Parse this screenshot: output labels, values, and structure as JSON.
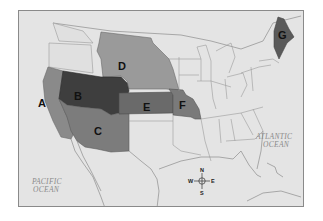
{
  "map": {
    "title": "",
    "regions": [
      {
        "id": "A",
        "label": "A",
        "color": "#8a8a8a",
        "x": 37,
        "y": 102
      },
      {
        "id": "B",
        "label": "B",
        "color": "#3e3e3e",
        "x": 77,
        "y": 95
      },
      {
        "id": "C",
        "label": "C",
        "color": "#7c7c7c",
        "x": 97,
        "y": 130
      },
      {
        "id": "D",
        "label": "D",
        "color": "#9a9a9a",
        "x": 121,
        "y": 65
      },
      {
        "id": "E",
        "label": "E",
        "color": "#6a6a6a",
        "x": 146,
        "y": 106
      },
      {
        "id": "F",
        "label": "F",
        "color": "#7a7a7a",
        "x": 182,
        "y": 104
      },
      {
        "id": "G",
        "label": "G",
        "color": "#5a5a5a",
        "x": 280,
        "y": 33
      }
    ],
    "oceans": [
      {
        "name": "pacific",
        "line1": "PACIFIC",
        "line2": "OCEAN"
      },
      {
        "name": "atlantic",
        "line1": "ATLANTIC",
        "line2": "OCEAN"
      }
    ],
    "compass": {
      "n": "N",
      "s": "S",
      "e": "E",
      "w": "W"
    },
    "colors": {
      "background": "#e4e4e4",
      "frame_border": "#8a8a8a",
      "state_lines": "#9a9a9a"
    }
  }
}
